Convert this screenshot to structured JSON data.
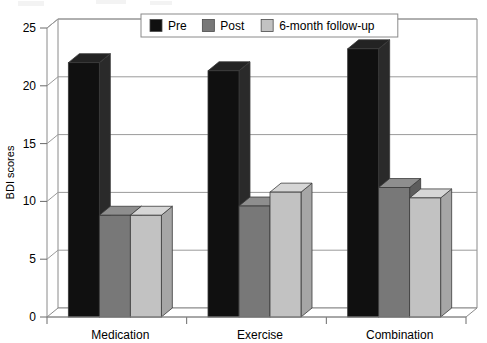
{
  "chart_data": {
    "type": "bar",
    "title": "",
    "subtitle": "",
    "xlabel": "",
    "ylabel": "BDI scores",
    "categories": [
      "Medication",
      "Exercise",
      "Combination"
    ],
    "series": [
      {
        "name": "Pre",
        "color": "#101010",
        "values": [
          22.0,
          21.3,
          23.2
        ]
      },
      {
        "name": "Post",
        "color": "#787878",
        "values": [
          8.8,
          9.6,
          11.2
        ]
      },
      {
        "name": "6-month follow-up",
        "color": "#c2c2c2",
        "values": [
          8.8,
          10.8,
          10.3
        ]
      }
    ],
    "ylim": [
      0,
      25
    ],
    "yticks": [
      0,
      5,
      10,
      15,
      20,
      25
    ],
    "ytick_labels": [
      "0",
      "5",
      "10",
      "15",
      "20",
      "25"
    ],
    "grid": true,
    "grid_axis": "y",
    "legend_position": "top-center",
    "style": "3d-column",
    "annotations": []
  },
  "legend": {
    "items": [
      {
        "label": "Pre",
        "color": "#101010"
      },
      {
        "label": "Post",
        "color": "#787878"
      },
      {
        "label": "6-month follow-up",
        "color": "#c2c2c2"
      }
    ]
  }
}
